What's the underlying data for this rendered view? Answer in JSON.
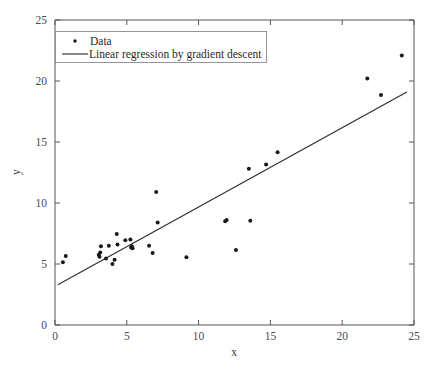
{
  "chart_data": {
    "type": "scatter",
    "title": "",
    "xlabel": "x",
    "ylabel": "y",
    "xlim": [
      0,
      25
    ],
    "ylim": [
      0,
      25
    ],
    "xticks": [
      "0",
      "5",
      "10",
      "15",
      "20",
      "25"
    ],
    "yticks": [
      "0",
      "5",
      "10",
      "15",
      "20",
      "25"
    ],
    "xtick_values": [
      0,
      5,
      10,
      15,
      20,
      25
    ],
    "ytick_values": [
      0,
      5,
      10,
      15,
      20,
      25
    ],
    "grid": false,
    "legend_position": "upper left",
    "series": [
      {
        "name": "Data",
        "type": "scatter",
        "marker": "dot",
        "color": "#1a1a1a",
        "points": [
          [
            0.55,
            5.15
          ],
          [
            0.75,
            5.65
          ],
          [
            3.05,
            5.75
          ],
          [
            3.1,
            5.6
          ],
          [
            3.15,
            5.95
          ],
          [
            3.2,
            6.45
          ],
          [
            3.55,
            5.45
          ],
          [
            3.75,
            6.5
          ],
          [
            4.0,
            5.0
          ],
          [
            4.15,
            5.35
          ],
          [
            4.3,
            7.45
          ],
          [
            4.35,
            6.6
          ],
          [
            4.9,
            6.95
          ],
          [
            5.25,
            7.0
          ],
          [
            5.3,
            6.35
          ],
          [
            5.35,
            6.45
          ],
          [
            5.4,
            6.3
          ],
          [
            6.55,
            6.5
          ],
          [
            6.8,
            5.9
          ],
          [
            7.05,
            10.9
          ],
          [
            7.15,
            8.4
          ],
          [
            9.15,
            5.55
          ],
          [
            11.85,
            8.5
          ],
          [
            11.95,
            8.6
          ],
          [
            12.6,
            6.15
          ],
          [
            13.5,
            12.8
          ],
          [
            13.6,
            8.55
          ],
          [
            14.7,
            13.15
          ],
          [
            15.5,
            14.15
          ],
          [
            21.75,
            20.2
          ],
          [
            22.7,
            18.85
          ],
          [
            24.15,
            22.1
          ]
        ]
      },
      {
        "name": "Linear regression by gradient descent",
        "type": "line",
        "color": "#2b2b2b",
        "endpoints": [
          [
            0.2,
            3.3
          ],
          [
            24.5,
            19.1
          ]
        ],
        "slope": 0.65,
        "intercept": 3.17
      }
    ],
    "legend_entries": [
      {
        "label": "Data",
        "marker": "dot"
      },
      {
        "label": "Linear regression by gradient descent",
        "marker": "line"
      }
    ]
  },
  "axes": {
    "x_title": "x",
    "y_title": "y"
  }
}
